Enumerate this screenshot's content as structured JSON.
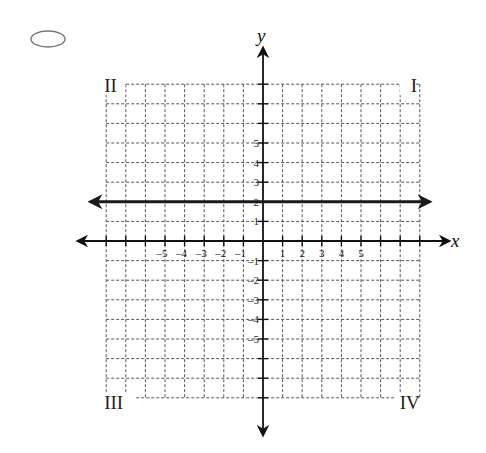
{
  "answer_choice": {
    "bubble_icon": "radio-bubble-icon",
    "selected": false
  },
  "chart_data": {
    "type": "line",
    "title": "",
    "xlabel": "x",
    "ylabel": "y",
    "xlim": [
      -8,
      8
    ],
    "ylim": [
      -8,
      8
    ],
    "grid": true,
    "grid_style": "dashed",
    "x_ticks": [
      -8,
      -7,
      -6,
      -5,
      -4,
      -3,
      -2,
      -1,
      1,
      2,
      3,
      4,
      5,
      6,
      7,
      8
    ],
    "y_ticks": [
      -8,
      -7,
      -6,
      -5,
      -4,
      -3,
      -2,
      -1,
      1,
      2,
      3,
      4,
      5,
      6,
      7,
      8
    ],
    "x_tick_labels": [
      {
        "value": -5,
        "label": "-5"
      },
      {
        "value": -4,
        "label": "-4"
      },
      {
        "value": -3,
        "label": "-3"
      },
      {
        "value": -2,
        "label": "-2"
      },
      {
        "value": -1,
        "label": "-1"
      },
      {
        "value": 1,
        "label": "1"
      },
      {
        "value": 2,
        "label": "2"
      },
      {
        "value": 3,
        "label": "3"
      },
      {
        "value": 4,
        "label": "4"
      },
      {
        "value": 5,
        "label": "5"
      }
    ],
    "y_tick_labels": [
      {
        "value": 5,
        "label": "5"
      },
      {
        "value": 4,
        "label": "4"
      },
      {
        "value": 3,
        "label": "3"
      },
      {
        "value": 2,
        "label": "2"
      },
      {
        "value": 1,
        "label": "1"
      },
      {
        "value": -1,
        "label": "-1"
      },
      {
        "value": -2,
        "label": "-2"
      },
      {
        "value": -3,
        "label": "-3"
      },
      {
        "value": -4,
        "label": "-4"
      },
      {
        "value": -5,
        "label": "-5"
      }
    ],
    "quadrant_labels": [
      {
        "label": "II",
        "position": "top-left"
      },
      {
        "label": "I",
        "position": "top-right"
      },
      {
        "label": "III",
        "position": "bottom-left"
      },
      {
        "label": "IV",
        "position": "bottom-right"
      }
    ],
    "series": [
      {
        "name": "y = 2",
        "equation": "y = 2",
        "kind": "horizontal line with arrows at both ends",
        "x": [
          -8.8,
          8.5
        ],
        "y": [
          2,
          2
        ],
        "color": "#1a1a1a"
      }
    ]
  },
  "layout": {
    "origin_px": [
      263,
      241
    ],
    "unit_px": 19.6,
    "grid_color": "#555555",
    "axis_color": "#111111"
  }
}
